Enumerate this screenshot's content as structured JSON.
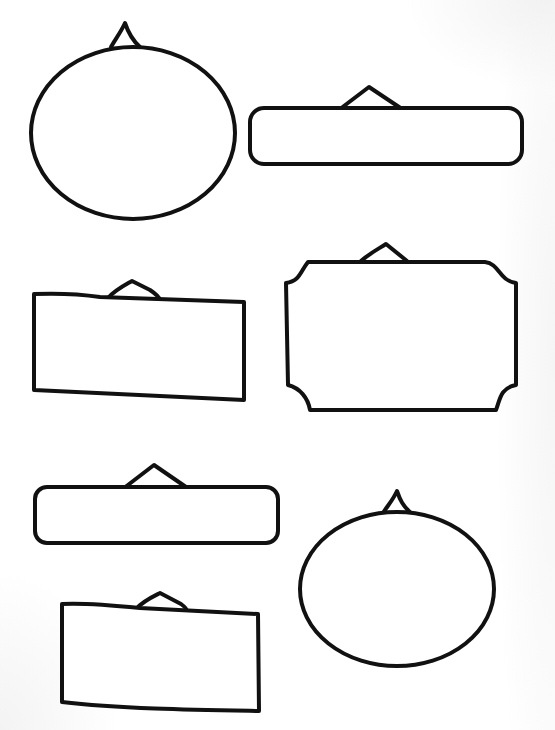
{
  "page": {
    "background": "#ffffff",
    "stroke_color": "#111111"
  },
  "shapes": [
    {
      "id": "oval-sign-top-left",
      "type": "oval",
      "label": "Round hanging sign"
    },
    {
      "id": "banner-sign-top-right",
      "type": "rounded-banner",
      "label": "Long rounded banner sign"
    },
    {
      "id": "rect-sign-middle-left",
      "type": "rectangle",
      "label": "Rectangular hanging sign"
    },
    {
      "id": "scalloped-sign-middle-right",
      "type": "scalloped-rectangle",
      "label": "Scalloped corner hanging sign"
    },
    {
      "id": "banner-sign-lower-left",
      "type": "rounded-banner",
      "label": "Long rounded banner sign"
    },
    {
      "id": "oval-sign-lower-right",
      "type": "oval",
      "label": "Oval hanging sign"
    },
    {
      "id": "rect-sign-bottom-left",
      "type": "rectangle",
      "label": "Rectangular hanging sign"
    }
  ]
}
